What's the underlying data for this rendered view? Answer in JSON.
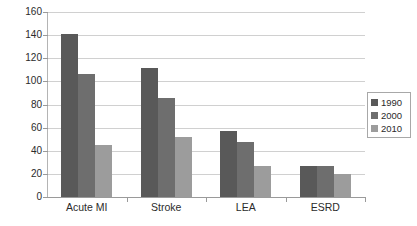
{
  "chart_data": {
    "type": "bar",
    "title": "",
    "subtitle": "",
    "xlabel": "",
    "ylabel": "",
    "categories": [
      "Acute MI",
      "Stroke",
      "LEA",
      "ESRD"
    ],
    "series": [
      {
        "name": "1990",
        "color": "#595959",
        "values": [
          141,
          112,
          57,
          27
        ]
      },
      {
        "name": "2000",
        "color": "#6e6e6e",
        "values": [
          106,
          86,
          48,
          27
        ]
      },
      {
        "name": "2010",
        "color": "#9c9c9c",
        "values": [
          45,
          52,
          27,
          20
        ]
      }
    ],
    "ylim": [
      0,
      160
    ],
    "ytick_step": 20,
    "ytick_labels": [
      "0",
      "20",
      "40",
      "60",
      "80",
      "100",
      "120",
      "140",
      "160"
    ],
    "grid": true,
    "grid_axis": "y",
    "legend_position": "right",
    "legend_entries": [
      "1990",
      "2000",
      "2010"
    ],
    "background_color": "#ffffff",
    "gridline_color": "#d0d0d0",
    "axis_color": "#9a9a9a"
  }
}
